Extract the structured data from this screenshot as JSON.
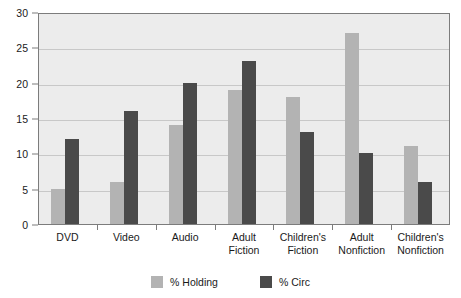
{
  "chart_data": {
    "type": "bar",
    "title": "",
    "xlabel": "",
    "ylabel": "",
    "ylim": [
      0,
      30
    ],
    "ytick_step": 5,
    "yticks": [
      0,
      5,
      10,
      15,
      20,
      25,
      30
    ],
    "grid": true,
    "legend_position": "bottom",
    "categories": [
      "DVD",
      "Video",
      "Audio",
      "Adult Fiction",
      "Children's Fiction",
      "Adult Nonfiction",
      "Children's Nonfiction"
    ],
    "series": [
      {
        "name": "% Holding",
        "color": "#b3b3b3",
        "values": [
          5,
          6,
          14,
          19,
          18,
          27,
          11
        ]
      },
      {
        "name": "% Circ",
        "color": "#4a4a4a",
        "values": [
          12,
          16,
          20,
          23,
          13,
          10,
          6
        ]
      }
    ]
  },
  "colors": {
    "plot_background": "#ececec",
    "axis_line": "#7c7c7c",
    "gridline": "#c8c8c8",
    "text": "#1a1a1a",
    "page_background": "#ffffff"
  }
}
